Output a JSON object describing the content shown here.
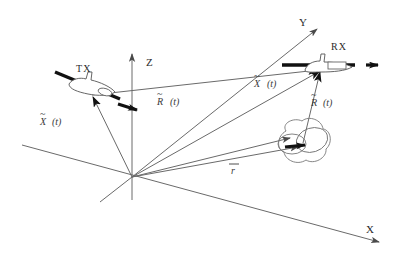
{
  "figure": {
    "type": "vector-geometry-diagram",
    "background_color": "#ffffff",
    "line_color": "#555555",
    "bold_color": "#1a1a1a",
    "text_color": "#2b2b2b"
  },
  "axes": {
    "origin": {
      "label": "O",
      "x": 132,
      "y": 177
    },
    "items": [
      {
        "name": "z-axis",
        "label": "Z",
        "label_x": 146,
        "label_y": 62,
        "from": {
          "x": 132,
          "y": 200
        },
        "to": {
          "x": 132,
          "y": 52
        },
        "arrow": true
      },
      {
        "name": "y-axis",
        "label": "Y",
        "label_x": 300,
        "label_y": 26,
        "from": {
          "x": 132,
          "y": 177
        },
        "to": {
          "x": 320,
          "y": 27
        },
        "arrow": true
      },
      {
        "name": "x-axis",
        "label": "X",
        "label_x": 369,
        "label_y": 232,
        "from": {
          "x": 22,
          "y": 145
        },
        "to": {
          "x": 381,
          "y": 243
        },
        "arrow": true
      }
    ]
  },
  "platforms": [
    {
      "name": "transmitter",
      "label": "TX",
      "label_x": 87,
      "label_y": 82,
      "x": 82,
      "y": 92,
      "heading_deg": 18,
      "velocity_arrow": true
    },
    {
      "name": "receiver",
      "label": "RX",
      "label_x": 337,
      "label_y": 56,
      "x": 325,
      "y": 65,
      "heading_deg": 0,
      "velocity_arrow": true
    }
  ],
  "target": {
    "name": "target-cloud",
    "x": 300,
    "y": 145,
    "velocity_arrow": true
  },
  "vectors": [
    {
      "name": "tx-position-vector",
      "symbol": "X",
      "accent": "tilde",
      "argument": "(t)",
      "label_x": 74,
      "label_y": 124,
      "from": {
        "x": 132,
        "y": 177
      },
      "to": {
        "x": 92,
        "y": 96
      }
    },
    {
      "name": "baseline-vector",
      "symbol": "R",
      "accent": "tilde",
      "argument": "(t)",
      "label_x": 163,
      "label_y": 105,
      "from": {
        "x": 92,
        "y": 96
      },
      "to": {
        "x": 318,
        "y": 70
      }
    },
    {
      "name": "rx-position-vector",
      "symbol": "X",
      "accent": "tilde",
      "argument": "(t)",
      "label_x": 258,
      "label_y": 86,
      "from": {
        "x": 132,
        "y": 177
      },
      "to": {
        "x": 318,
        "y": 70
      }
    },
    {
      "name": "target-to-rx-vector",
      "symbol": "R",
      "accent": "tilde",
      "argument": "(t)",
      "label_x": 314,
      "label_y": 105,
      "from": {
        "x": 303,
        "y": 142
      },
      "to": {
        "x": 318,
        "y": 70
      }
    },
    {
      "name": "target-position-vector",
      "symbol": "r",
      "accent": "bar",
      "argument": "",
      "label_x": 232,
      "label_y": 172,
      "from": {
        "x": 132,
        "y": 177
      },
      "to": {
        "x": 297,
        "y": 147
      }
    },
    {
      "name": "tx-to-target-vector",
      "symbol": "",
      "accent": "",
      "argument": "",
      "label_x": 0,
      "label_y": 0,
      "from": {
        "x": 132,
        "y": 177
      },
      "to": {
        "x": 288,
        "y": 137
      }
    }
  ]
}
